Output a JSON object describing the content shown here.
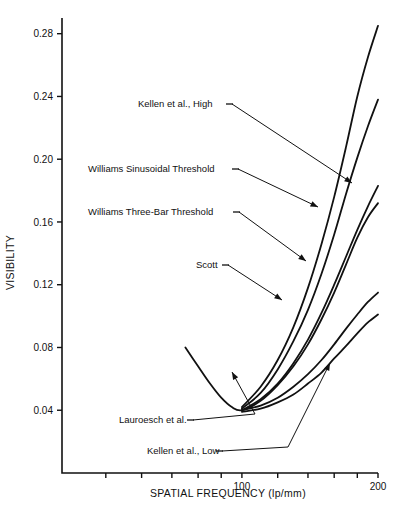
{
  "chart_data": {
    "type": "line",
    "title": "",
    "xlabel": "SPATIAL FREQUENCY (lp/mm)",
    "ylabel": "VISIBILITY",
    "xscale": "log",
    "yscale": "linear",
    "xlim": [
      40,
      200
    ],
    "ylim": [
      0.0,
      0.29
    ],
    "grid": false,
    "legend": "none (inline leader-line annotations)",
    "y_ticks": [
      0.04,
      0.08,
      0.12,
      0.16,
      0.2,
      0.24,
      0.28
    ],
    "y_tick_labels": [
      "0.04",
      "0.08",
      "0.12",
      "0.16",
      "0.20",
      "0.24",
      "0.28"
    ],
    "x_ticks": [
      50,
      60,
      70,
      80,
      90,
      100,
      120,
      140,
      160,
      180,
      200
    ],
    "x_tick_labels": [
      "",
      "",
      "",
      "",
      "",
      "100",
      "",
      "",
      "",
      "",
      "200"
    ],
    "series": [
      {
        "name": "Kellen et al., High",
        "color": "#111111",
        "points": [
          [
            100,
            0.042
          ],
          [
            110,
            0.055
          ],
          [
            120,
            0.072
          ],
          [
            130,
            0.093
          ],
          [
            140,
            0.118
          ],
          [
            150,
            0.146
          ],
          [
            160,
            0.176
          ],
          [
            170,
            0.208
          ],
          [
            180,
            0.24
          ],
          [
            190,
            0.265
          ],
          [
            200,
            0.285
          ]
        ]
      },
      {
        "name": "Williams Sinusoidal Threshold",
        "color": "#111111",
        "points": [
          [
            100,
            0.041
          ],
          [
            110,
            0.051
          ],
          [
            120,
            0.066
          ],
          [
            130,
            0.084
          ],
          [
            140,
            0.104
          ],
          [
            150,
            0.127
          ],
          [
            160,
            0.152
          ],
          [
            170,
            0.178
          ],
          [
            180,
            0.201
          ],
          [
            190,
            0.221
          ],
          [
            200,
            0.238
          ]
        ]
      },
      {
        "name": "Williams Three-Bar Threshold",
        "color": "#111111",
        "points": [
          [
            100,
            0.04
          ],
          [
            110,
            0.047
          ],
          [
            120,
            0.057
          ],
          [
            130,
            0.07
          ],
          [
            140,
            0.085
          ],
          [
            150,
            0.102
          ],
          [
            160,
            0.12
          ],
          [
            170,
            0.138
          ],
          [
            180,
            0.155
          ],
          [
            190,
            0.17
          ],
          [
            200,
            0.183
          ]
        ]
      },
      {
        "name": "Scott",
        "color": "#111111",
        "points": [
          [
            75,
            0.08
          ],
          [
            80,
            0.068
          ],
          [
            85,
            0.057
          ],
          [
            90,
            0.048
          ],
          [
            95,
            0.042
          ],
          [
            100,
            0.04
          ],
          [
            110,
            0.046
          ],
          [
            120,
            0.056
          ],
          [
            130,
            0.068
          ],
          [
            140,
            0.082
          ],
          [
            150,
            0.098
          ],
          [
            160,
            0.115
          ],
          [
            170,
            0.133
          ],
          [
            180,
            0.15
          ],
          [
            190,
            0.163
          ],
          [
            200,
            0.172
          ]
        ]
      },
      {
        "name": "Lauroesch et al.",
        "color": "#111111",
        "points": [
          [
            100,
            0.04
          ],
          [
            110,
            0.043
          ],
          [
            120,
            0.048
          ],
          [
            130,
            0.055
          ],
          [
            140,
            0.063
          ],
          [
            150,
            0.072
          ],
          [
            160,
            0.082
          ],
          [
            170,
            0.092
          ],
          [
            180,
            0.101
          ],
          [
            190,
            0.109
          ],
          [
            200,
            0.115
          ]
        ]
      },
      {
        "name": "Kellen et al., Low",
        "color": "#111111",
        "points": [
          [
            100,
            0.039
          ],
          [
            110,
            0.041
          ],
          [
            120,
            0.045
          ],
          [
            130,
            0.05
          ],
          [
            140,
            0.057
          ],
          [
            150,
            0.064
          ],
          [
            160,
            0.073
          ],
          [
            170,
            0.081
          ],
          [
            180,
            0.089
          ],
          [
            190,
            0.096
          ],
          [
            200,
            0.101
          ]
        ]
      }
    ],
    "annotations": [
      {
        "label": "Kellen et al., High",
        "text_x": 138,
        "text_y": 107,
        "dash_x1": 226,
        "dash_y1": 104,
        "path": "M232,104 L352,183",
        "arrow_at": [
          352,
          183
        ]
      },
      {
        "label": "Williams Sinusoidal Threshold",
        "text_x": 88,
        "text_y": 172,
        "dash_x1": 232,
        "dash_y1": 169,
        "path": "M238,169 L318,207",
        "arrow_at": [
          318,
          207
        ]
      },
      {
        "label": "Williams Three-Bar Threshold",
        "text_x": 88,
        "text_y": 215,
        "dash_x1": 233,
        "dash_y1": 212,
        "path": "M239,212 L306,261",
        "arrow_at": [
          306,
          261
        ]
      },
      {
        "label": "Scott",
        "text_x": 196,
        "text_y": 268,
        "dash_x1": 222,
        "dash_y1": 265,
        "path": "M228,265 L282,300",
        "arrow_at": [
          282,
          300
        ]
      },
      {
        "label": "Lauroesch et al.",
        "text_x": 119,
        "text_y": 423,
        "dash_x1": 187,
        "dash_y1": 420,
        "path": "M193,420 L255,414 L232,372",
        "arrow_at": [
          232,
          372
        ]
      },
      {
        "label": "Kellen et al., Low",
        "text_x": 147,
        "text_y": 454,
        "dash_x1": 216,
        "dash_y1": 451,
        "path": "M222,451 L288,447 L330,363",
        "arrow_at": [
          330,
          363
        ]
      }
    ]
  }
}
